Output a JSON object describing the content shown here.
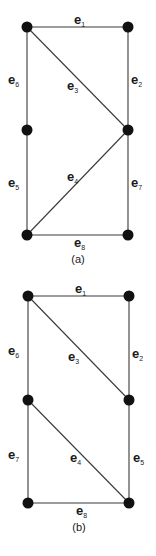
{
  "figures": [
    {
      "id": "a",
      "caption": "(a)",
      "nodes": [
        {
          "id": "a-tl",
          "x": 27,
          "y": 27
        },
        {
          "id": "a-tr",
          "x": 128,
          "y": 27
        },
        {
          "id": "a-ml",
          "x": 27,
          "y": 130
        },
        {
          "id": "a-mr",
          "x": 128,
          "y": 130
        },
        {
          "id": "a-bl",
          "x": 27,
          "y": 235
        },
        {
          "id": "a-br",
          "x": 128,
          "y": 235
        }
      ],
      "edges": [
        {
          "label": "e",
          "sub": "1",
          "from": "a-tl",
          "to": "a-tr"
        },
        {
          "label": "e",
          "sub": "2",
          "from": "a-tr",
          "to": "a-mr"
        },
        {
          "label": "e",
          "sub": "3",
          "from": "a-tl",
          "to": "a-mr"
        },
        {
          "label": "e",
          "sub": "4",
          "from": "a-bl",
          "to": "a-mr"
        },
        {
          "label": "e",
          "sub": "5",
          "from": "a-ml",
          "to": "a-bl"
        },
        {
          "label": "e",
          "sub": "6",
          "from": "a-tl",
          "to": "a-ml"
        },
        {
          "label": "e",
          "sub": "7",
          "from": "a-mr",
          "to": "a-br"
        },
        {
          "label": "e",
          "sub": "8",
          "from": "a-bl",
          "to": "a-br"
        }
      ]
    },
    {
      "id": "b",
      "caption": "(b)",
      "nodes": [
        {
          "id": "b-tl",
          "x": 28,
          "y": 296
        },
        {
          "id": "b-tr",
          "x": 129,
          "y": 296
        },
        {
          "id": "b-ml",
          "x": 28,
          "y": 400
        },
        {
          "id": "b-mr",
          "x": 129,
          "y": 400
        },
        {
          "id": "b-bl",
          "x": 28,
          "y": 503
        },
        {
          "id": "b-br",
          "x": 129,
          "y": 503
        }
      ],
      "edges": [
        {
          "label": "e",
          "sub": "1",
          "from": "b-tl",
          "to": "b-tr"
        },
        {
          "label": "e",
          "sub": "2",
          "from": "b-tr",
          "to": "b-mr"
        },
        {
          "label": "e",
          "sub": "3",
          "from": "b-tl",
          "to": "b-mr"
        },
        {
          "label": "e",
          "sub": "4",
          "from": "b-ml",
          "to": "b-br"
        },
        {
          "label": "e",
          "sub": "5",
          "from": "b-mr",
          "to": "b-br"
        },
        {
          "label": "e",
          "sub": "6",
          "from": "b-tl",
          "to": "b-ml"
        },
        {
          "label": "e",
          "sub": "7",
          "from": "b-ml",
          "to": "b-bl"
        },
        {
          "label": "e",
          "sub": "8",
          "from": "b-bl",
          "to": "b-br"
        }
      ]
    }
  ]
}
